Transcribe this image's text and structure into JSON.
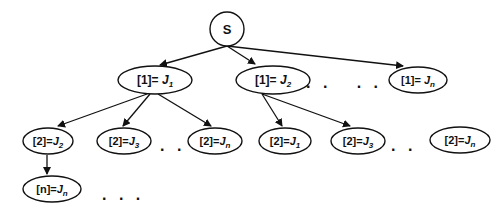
{
  "diagram": {
    "root": {
      "label": "S"
    },
    "level1": [
      {
        "prefix": "[1]= ",
        "var": "J",
        "sub": "1"
      },
      {
        "prefix": "[1]= ",
        "var": "J",
        "sub": "2"
      },
      {
        "prefix": "[1]= ",
        "var": "J",
        "sub": "n"
      }
    ],
    "level1_ellipsis": ". .   . .",
    "level2": [
      {
        "prefix": "[2]=",
        "var": "J",
        "sub": "2"
      },
      {
        "prefix": "[2]=",
        "var": "J",
        "sub": "3"
      },
      {
        "prefix": "[2]=",
        "var": "J",
        "sub": "n"
      },
      {
        "prefix": "[2]=",
        "var": "J",
        "sub": "1"
      },
      {
        "prefix": "[2]=",
        "var": "J",
        "sub": "3"
      },
      {
        "prefix": "[2]=",
        "var": "J",
        "sub": "n"
      }
    ],
    "level2_ellipsis_a": ". .",
    "level2_ellipsis_b": ". .",
    "level3": [
      {
        "prefix": "[n]=",
        "var": "J",
        "sub": "n"
      }
    ],
    "level3_ellipsis": ". . .",
    "colors": {
      "stroke": "#111111",
      "background": "#ffffff"
    }
  }
}
